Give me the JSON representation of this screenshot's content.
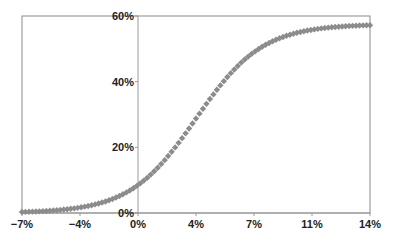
{
  "chart_data": {
    "type": "scatter",
    "title": "",
    "xlabel": "",
    "ylabel": "",
    "xlim": [
      -7,
      14
    ],
    "ylim": [
      0,
      60
    ],
    "grid": false,
    "legend": null,
    "x_ticks": [
      -7,
      -3.5,
      0,
      3.5,
      7,
      10.5,
      14
    ],
    "x_tick_labels": [
      "−7%",
      "−4%",
      "0%",
      "4%",
      "7%",
      "11%",
      "14%"
    ],
    "y_ticks": [
      0,
      20,
      40,
      60
    ],
    "y_tick_labels": [
      "0%",
      "20%",
      "40%",
      "60%"
    ],
    "series": [
      {
        "name": "S-curve",
        "marker": "diamond",
        "color": "#8c8c8c",
        "x": [
          -7,
          -6,
          -5,
          -4,
          -3,
          -2,
          -1,
          0,
          1,
          2,
          3,
          4,
          5,
          6,
          7,
          8,
          9,
          10,
          11,
          12,
          13,
          14
        ],
        "y": [
          0.3,
          0.6,
          0.8,
          1.3,
          2.2,
          3.5,
          5.6,
          8.8,
          13.3,
          19.2,
          25.9,
          32.6,
          38.9,
          44.3,
          48.4,
          51.6,
          53.8,
          55.1,
          56.1,
          56.7,
          57.1,
          57.3
        ]
      }
    ],
    "model": {
      "form": "logistic",
      "L": 57.5,
      "x0": 3.5,
      "k": 0.5
    }
  },
  "axes": {
    "color": "#9a9a9a",
    "frame_color": "#8a8a8a"
  }
}
